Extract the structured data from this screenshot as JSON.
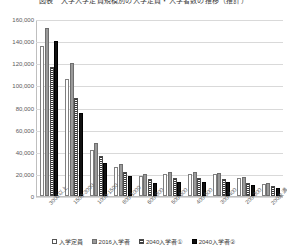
{
  "chart_data": {
    "type": "bar",
    "title": "図表　大学入学定員規模別の入学定員・入学者数の推移（推計）",
    "xlabel": "",
    "ylabel": "",
    "ylim": [
      0,
      160000
    ],
    "ytick_step": 20000,
    "grid": true,
    "legend_position": "bottom",
    "yticks": [
      "160,000",
      "140,000",
      "120,000",
      "100,000",
      "80,000",
      "60,000",
      "40,000",
      "20,000",
      "0"
    ],
    "categories": [
      "3000以上",
      "1500-3000",
      "1000-1500",
      "800-1000",
      "600-800",
      "500-600",
      "400-500",
      "300-400",
      "200-300",
      "200未満"
    ],
    "series": [
      {
        "name": "入学定員",
        "style": "outline",
        "values": [
          136000,
          106000,
          42000,
          26000,
          18000,
          20000,
          20000,
          20000,
          16000,
          11000
        ]
      },
      {
        "name": "2016入学者",
        "style": "solid-gray",
        "values": [
          152000,
          120000,
          48000,
          29000,
          20000,
          22000,
          22000,
          21000,
          17000,
          12000
        ]
      },
      {
        "name": "2040入学者①",
        "style": "hatched",
        "values": [
          117000,
          89000,
          36000,
          22000,
          15000,
          16000,
          16000,
          15000,
          12000,
          9000
        ]
      },
      {
        "name": "2040入学者②",
        "style": "solid-black",
        "values": [
          140000,
          75000,
          30000,
          18000,
          12000,
          13000,
          13000,
          13000,
          10000,
          7000
        ]
      }
    ]
  },
  "legend": {
    "items": [
      {
        "label": "入学定員"
      },
      {
        "label": "2016入学者"
      },
      {
        "label": "2040入学者①"
      },
      {
        "label": "2040入学者②"
      }
    ]
  },
  "colors": {
    "grid": "#d9d9d9",
    "axis": "#bfbfbf",
    "text": "#5a5a5a",
    "series_outline": "#ffffff",
    "series_gray": "#9a9a9a",
    "series_hatch": "#3a3a3a",
    "series_black": "#111111"
  }
}
